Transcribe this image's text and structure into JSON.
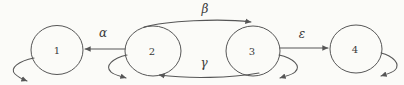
{
  "diagram": {
    "type": "state-transition-diagram",
    "states": [
      {
        "id": "1",
        "label": "1"
      },
      {
        "id": "2",
        "label": "2"
      },
      {
        "id": "3",
        "label": "3"
      },
      {
        "id": "4",
        "label": "4"
      }
    ],
    "transitions": [
      {
        "from": "2",
        "to": "1",
        "label": "α",
        "position": "middle-left-horizontal"
      },
      {
        "from": "2",
        "to": "3",
        "label": "β",
        "position": "top-arc"
      },
      {
        "from": "3",
        "to": "2",
        "label": "γ",
        "position": "bottom-arc"
      },
      {
        "from": "3",
        "to": "4",
        "label": "ε",
        "position": "middle-right-horizontal"
      }
    ],
    "self_loops": [
      {
        "state": "1",
        "side": "bottom-left"
      },
      {
        "state": "2",
        "side": "bottom-left"
      },
      {
        "state": "3",
        "side": "bottom-right"
      },
      {
        "state": "4",
        "side": "bottom-right"
      }
    ],
    "colors": {
      "background": "#fbfbf8",
      "stroke": "#565656",
      "text": "#3a3a3a"
    }
  }
}
